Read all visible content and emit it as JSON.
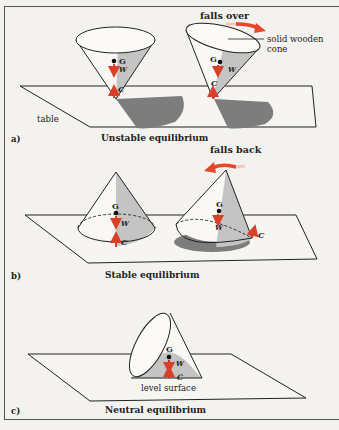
{
  "figure": {
    "colors": {
      "background": "#f3f2ef",
      "line": "#222222",
      "shade_light": "#c4c4c4",
      "shadow": "#808080",
      "force_arrow": "#d8402a",
      "motion_arrow": "#e8452a"
    },
    "panels": [
      {
        "id": "a",
        "label": "a)",
        "caption": "Unstable equilibrium",
        "annotations": {
          "falls_over": "falls over",
          "solid_wooden_cone_line1": "solid wooden",
          "solid_wooden_cone_line2": "cone",
          "table": "table"
        },
        "points": {
          "G": "G",
          "W": "W",
          "C": "C"
        }
      },
      {
        "id": "b",
        "label": "b)",
        "caption": "Stable equilibrium",
        "annotations": {
          "falls_back": "falls back"
        },
        "points": {
          "G": "G",
          "W": "W",
          "C": "C"
        }
      },
      {
        "id": "c",
        "label": "c)",
        "caption": "Neutral equilibrium",
        "annotations": {
          "level_surface": "level surface"
        },
        "points": {
          "G": "G",
          "W": "W",
          "C": "C"
        }
      }
    ]
  }
}
